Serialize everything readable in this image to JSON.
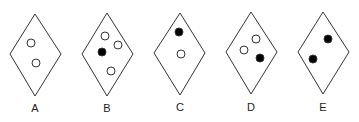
{
  "figure": {
    "stroke_color": "#333333",
    "fill_dark": "#000000",
    "fill_light": "#ffffff",
    "options": [
      {
        "label": "A",
        "cx": 35,
        "top": 14,
        "bottom": 96,
        "left": 10,
        "right": 61,
        "mid": 54,
        "label_y": 112,
        "dots": [
          {
            "x": 31,
            "y": 43,
            "filled": false
          },
          {
            "x": 36,
            "y": 63,
            "filled": false
          }
        ]
      },
      {
        "label": "B",
        "cx": 107,
        "top": 13,
        "bottom": 96,
        "left": 82,
        "right": 133,
        "mid": 54,
        "label_y": 112,
        "dots": [
          {
            "x": 105,
            "y": 36,
            "filled": false
          },
          {
            "x": 118,
            "y": 45,
            "filled": false
          },
          {
            "x": 102,
            "y": 52,
            "filled": true
          },
          {
            "x": 111,
            "y": 71,
            "filled": false
          }
        ]
      },
      {
        "label": "C",
        "cx": 180,
        "top": 13,
        "bottom": 95,
        "left": 154,
        "right": 205,
        "mid": 53,
        "label_y": 111,
        "dots": [
          {
            "x": 179,
            "y": 32,
            "filled": true
          },
          {
            "x": 181,
            "y": 54,
            "filled": false
          }
        ]
      },
      {
        "label": "D",
        "cx": 251,
        "top": 12,
        "bottom": 94,
        "left": 226,
        "right": 277,
        "mid": 52,
        "label_y": 111,
        "dots": [
          {
            "x": 256,
            "y": 39,
            "filled": false
          },
          {
            "x": 244,
            "y": 50,
            "filled": false
          },
          {
            "x": 260,
            "y": 58,
            "filled": true
          }
        ]
      },
      {
        "label": "E",
        "cx": 323,
        "top": 12,
        "bottom": 94,
        "left": 298,
        "right": 349,
        "mid": 52,
        "label_y": 111,
        "dots": [
          {
            "x": 328,
            "y": 39,
            "filled": true
          },
          {
            "x": 313,
            "y": 59,
            "filled": true
          }
        ]
      }
    ]
  }
}
